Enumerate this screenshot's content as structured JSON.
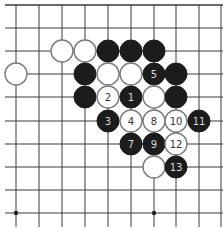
{
  "board": {
    "columns_x": [
      16,
      39,
      62,
      85,
      108,
      131,
      154,
      176,
      199,
      221
    ],
    "rows_y": [
      5,
      28,
      51,
      74,
      97,
      121,
      144,
      167,
      190,
      213
    ],
    "line_x_start": 5,
    "line_x_end": 223,
    "line_y_end": 227,
    "stone_radius": 11,
    "colors": {
      "black": "#1c1c1c",
      "white": "#ffffff",
      "white_outline": "#7a7a7a",
      "grid": "#3a3a3a"
    }
  },
  "star_points": [
    {
      "col": 0,
      "row": 9
    },
    {
      "col": 6,
      "row": 9
    }
  ],
  "stones": [
    {
      "color": "white",
      "col": 2,
      "row": 2,
      "label": ""
    },
    {
      "color": "white",
      "col": 3,
      "row": 2,
      "label": ""
    },
    {
      "color": "black",
      "col": 4,
      "row": 2,
      "label": ""
    },
    {
      "color": "black",
      "col": 5,
      "row": 2,
      "label": ""
    },
    {
      "color": "black",
      "col": 6,
      "row": 2,
      "label": ""
    },
    {
      "color": "white",
      "col": 0,
      "row": 3,
      "label": ""
    },
    {
      "color": "black",
      "col": 3,
      "row": 3,
      "label": ""
    },
    {
      "color": "white",
      "col": 4,
      "row": 3,
      "label": ""
    },
    {
      "color": "white",
      "col": 5,
      "row": 3,
      "label": ""
    },
    {
      "color": "black",
      "col": 6,
      "row": 3,
      "label": "5"
    },
    {
      "color": "black",
      "col": 7,
      "row": 3,
      "label": ""
    },
    {
      "color": "black",
      "col": 3,
      "row": 4,
      "label": ""
    },
    {
      "color": "white",
      "col": 4,
      "row": 4,
      "label": "2"
    },
    {
      "color": "black",
      "col": 5,
      "row": 4,
      "label": "1"
    },
    {
      "color": "white",
      "col": 6,
      "row": 4,
      "label": ""
    },
    {
      "color": "black",
      "col": 7,
      "row": 4,
      "label": ""
    },
    {
      "color": "black",
      "col": 4,
      "row": 5,
      "label": "3"
    },
    {
      "color": "white",
      "col": 5,
      "row": 5,
      "label": "4"
    },
    {
      "color": "white",
      "col": 6,
      "row": 5,
      "label": "8"
    },
    {
      "color": "white",
      "col": 7,
      "row": 5,
      "label": "10"
    },
    {
      "color": "black",
      "col": 8,
      "row": 5,
      "label": "11"
    },
    {
      "color": "black",
      "col": 5,
      "row": 6,
      "label": "7"
    },
    {
      "color": "black",
      "col": 6,
      "row": 6,
      "label": "9"
    },
    {
      "color": "white",
      "col": 7,
      "row": 6,
      "label": "12"
    },
    {
      "color": "white",
      "col": 6,
      "row": 7,
      "label": ""
    },
    {
      "color": "black",
      "col": 7,
      "row": 7,
      "label": "13"
    }
  ]
}
